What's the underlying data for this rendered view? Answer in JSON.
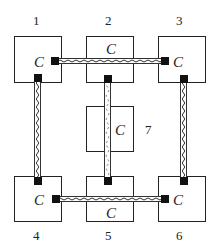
{
  "diagram": {
    "colors": {
      "stroke": "#222222",
      "terminal": "#111111",
      "background": "#ffffff"
    },
    "nodes": [
      {
        "id": "1",
        "number": "1",
        "label": "C"
      },
      {
        "id": "2",
        "number": "2",
        "label": "C"
      },
      {
        "id": "3",
        "number": "3",
        "label": "C"
      },
      {
        "id": "4",
        "number": "4",
        "label": "C"
      },
      {
        "id": "5",
        "number": "5",
        "label": "C"
      },
      {
        "id": "6",
        "number": "6",
        "label": "C"
      },
      {
        "id": "7",
        "number": "7",
        "label": "C"
      }
    ],
    "connections": [
      {
        "from": "1",
        "to": "3",
        "orientation": "horizontal",
        "passes_through": "2"
      },
      {
        "from": "1",
        "to": "4",
        "orientation": "vertical"
      },
      {
        "from": "3",
        "to": "6",
        "orientation": "vertical"
      },
      {
        "from": "2",
        "to": "5",
        "orientation": "vertical",
        "passes_through": "7"
      },
      {
        "from": "4",
        "to": "6",
        "orientation": "horizontal",
        "passes_through": "5"
      }
    ]
  }
}
